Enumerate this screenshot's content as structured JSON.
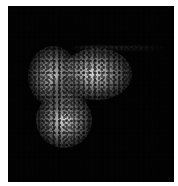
{
  "image": {
    "description": "Grayscale fluorescence micrograph: bright speckled cell-like structure with three lobes on black background",
    "background_color": "#ffffff",
    "field_color": "#030303",
    "lobes": [
      {
        "name": "upper-left-lobe",
        "cx": 52,
        "cy": 75,
        "rx": 24,
        "ry": 28,
        "peak": "#bdbdbd"
      },
      {
        "name": "upper-right-lobe",
        "cx": 92,
        "cy": 70,
        "rx": 32,
        "ry": 24,
        "peak": "#d6d6d6"
      },
      {
        "name": "lower-lobe",
        "cx": 61,
        "cy": 115,
        "rx": 26,
        "ry": 25,
        "peak": "#cfcfcf"
      }
    ],
    "streak": {
      "x": 70,
      "y": 44,
      "width": 95,
      "color": "#464646"
    }
  }
}
